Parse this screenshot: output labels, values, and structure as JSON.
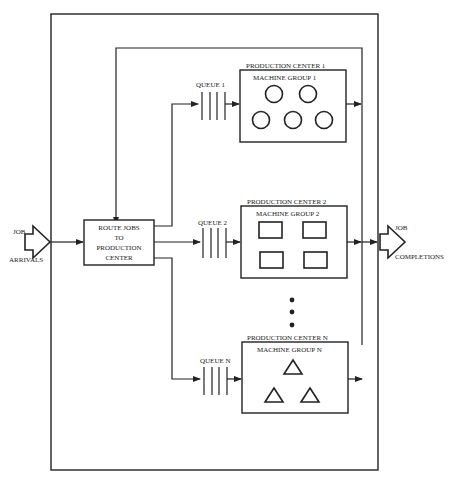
{
  "diagram": {
    "input": {
      "line1": "JOB",
      "line2": "ARRIVALS"
    },
    "output": {
      "line1": "JOB",
      "line2": "COMPLETIONS"
    },
    "router": {
      "lines": [
        "ROUTE JOBS",
        "TO",
        "PRODUCTION",
        "CENTER"
      ]
    },
    "centers": [
      {
        "title": "PRODUCTION CENTER 1",
        "group": "MACHINE GROUP 1",
        "queue": "QUEUE 1",
        "machine_shape": "circle",
        "machine_count": 5
      },
      {
        "title": "PRODUCTION CENTER 2",
        "group": "MACHINE GROUP 2",
        "queue": "QUEUE 2",
        "machine_shape": "rectangle",
        "machine_count": 4
      },
      {
        "title": "PRODUCTION CENTER N",
        "group": "MACHINE GROUP N",
        "queue": "QUEUE N",
        "machine_shape": "triangle",
        "machine_count": 3
      }
    ],
    "ellipsis": "vertical-dots"
  }
}
